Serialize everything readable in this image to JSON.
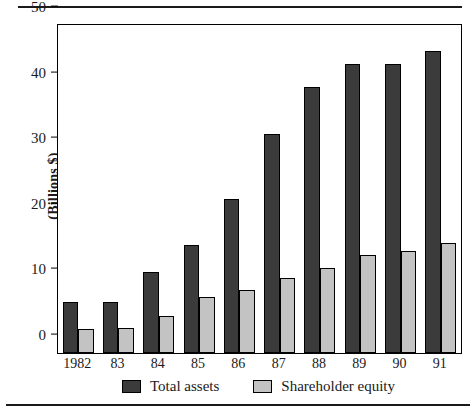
{
  "chart_data": {
    "type": "bar",
    "title": "",
    "xlabel": "",
    "ylabel": "(Billions $)",
    "categories": [
      "1982",
      "83",
      "84",
      "85",
      "86",
      "87",
      "88",
      "89",
      "90",
      "91"
    ],
    "series": [
      {
        "name": "Total assets",
        "color": "#3b3b3b",
        "values": [
          7.8,
          7.8,
          12.3,
          16.4,
          23.5,
          33.4,
          40.6,
          44.0,
          44.0,
          46.1
        ]
      },
      {
        "name": "Shareholder equity",
        "color": "#c3c3c3",
        "values": [
          3.6,
          3.8,
          5.6,
          8.5,
          9.6,
          11.5,
          12.9,
          15.0,
          15.6,
          16.8
        ]
      }
    ],
    "ylim": [
      0,
      50
    ],
    "yticks": [
      0,
      10,
      20,
      30,
      40,
      50
    ],
    "ytick_labels": [
      "0",
      "10",
      "20",
      "30",
      "40",
      "50"
    ],
    "grid": false,
    "legend_position": "bottom"
  }
}
